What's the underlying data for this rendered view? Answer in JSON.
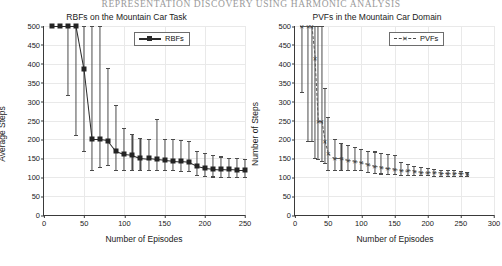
{
  "running_head": "REPRESENTATION DISCOVERY USING HARMONIC ANALYSIS",
  "figures": [
    {
      "id": "rbf",
      "title": "RBFs on the Mountain Car Task",
      "legend": {
        "label": "RBFs",
        "marker": "filled-square",
        "line": "solid"
      },
      "chart_data": {
        "type": "line",
        "title": "RBFs on the Mountain Car Task",
        "xlabel": "Number of Episodes",
        "ylabel": "Average Steps",
        "xlim": [
          0,
          250
        ],
        "ylim": [
          0,
          500
        ],
        "xticks": [
          0,
          50,
          100,
          150,
          200,
          250
        ],
        "yticks": [
          0,
          50,
          100,
          150,
          200,
          250,
          300,
          350,
          400,
          450,
          500
        ],
        "grid": true,
        "legend_position": "top-right",
        "series": [
          {
            "name": "RBFs",
            "marker": "filled-square",
            "line": "solid",
            "x": [
              10,
              20,
              30,
              40,
              50,
              60,
              70,
              80,
              90,
              100,
              110,
              120,
              130,
              140,
              150,
              160,
              170,
              180,
              190,
              200,
              210,
              220,
              230,
              240,
              250
            ],
            "values": [
              500,
              500,
              500,
              500,
              385,
              200,
              200,
              197,
              170,
              162,
              160,
              152,
              150,
              147,
              145,
              143,
              142,
              140,
              130,
              125,
              123,
              122,
              121,
              120,
              120
            ],
            "err_low": [
              500,
              500,
              318,
              212,
              170,
              120,
              128,
              132,
              120,
              119,
              118,
              118,
              118,
              118,
              118,
              118,
              117,
              116,
              105,
              103,
              102,
              101,
              101,
              100,
              100
            ],
            "err_high": [
              500,
              500,
              500,
              500,
              500,
              500,
              500,
              390,
              290,
              230,
              215,
              205,
              200,
              255,
              200,
              200,
              198,
              195,
              170,
              165,
              160,
              155,
              152,
              150,
              148
            ]
          }
        ]
      }
    },
    {
      "id": "pvf",
      "title": "PVFs in the Mountain Car Domain",
      "legend": {
        "label": "PVFs",
        "marker": "x-marker",
        "line": "dashed"
      },
      "chart_data": {
        "type": "line",
        "title": "PVFs in the Mountain Car Domain",
        "xlabel": "Number of Episodes",
        "ylabel": "Number of Steps",
        "xlim": [
          0,
          300
        ],
        "ylim": [
          0,
          500
        ],
        "xticks": [
          0,
          50,
          100,
          150,
          200,
          250,
          300
        ],
        "yticks": [
          0,
          50,
          100,
          150,
          200,
          250,
          300,
          350,
          400,
          450,
          500
        ],
        "grid": true,
        "legend_position": "top-right",
        "series": [
          {
            "name": "PVFs",
            "marker": "x-marker",
            "line": "dashed",
            "x": [
              10,
              20,
              25,
              30,
              35,
              40,
              45,
              50,
              60,
              70,
              80,
              90,
              100,
              110,
              120,
              130,
              140,
              150,
              160,
              170,
              180,
              190,
              200,
              210,
              220,
              230,
              240,
              250,
              260
            ],
            "values": [
              500,
              500,
              500,
              415,
              250,
              250,
              195,
              165,
              150,
              150,
              145,
              143,
              140,
              135,
              130,
              128,
              125,
              123,
              120,
              118,
              117,
              115,
              114,
              113,
              112,
              112,
              111,
              111,
              110
            ],
            "err_low": [
              325,
              195,
              195,
              150,
              148,
              143,
              138,
              120,
              120,
              118,
              118,
              118,
              118,
              115,
              112,
              110,
              108,
              108,
              107,
              106,
              105,
              105,
              105,
              104,
              104,
              104,
              103,
              103,
              103
            ],
            "err_high": [
              500,
              500,
              500,
              500,
              500,
              500,
              335,
              260,
              200,
              190,
              185,
              180,
              175,
              170,
              168,
              165,
              162,
              160,
              140,
              135,
              130,
              128,
              125,
              122,
              120,
              118,
              118,
              116,
              115
            ]
          }
        ]
      }
    }
  ]
}
